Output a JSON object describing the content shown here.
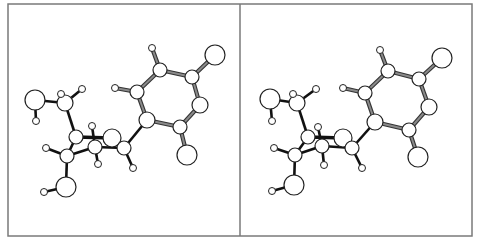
{
  "figure": {
    "type": "stereo-pair ball-and-stick molecular model",
    "frame": {
      "x": 8,
      "y": 4,
      "width": 464,
      "height": 232,
      "divider_x": 240,
      "stroke": "#7a7a7a"
    },
    "colors": {
      "atom_fill": "#ffffff",
      "atom_stroke": "#222222",
      "bond_dark": "#111111",
      "bond_ring_fill": "#8a8a8a",
      "bond_ring_edge": "#333333"
    },
    "panels": [
      {
        "name": "left-view",
        "atoms": [
          {
            "id": "a1",
            "el": "X",
            "x": 215,
            "y": 55,
            "r": 10
          },
          {
            "id": "a2",
            "el": "X",
            "x": 187,
            "y": 155,
            "r": 10
          },
          {
            "id": "a3",
            "el": "O",
            "x": 35,
            "y": 100,
            "r": 10
          },
          {
            "id": "a4",
            "el": "O",
            "x": 112,
            "y": 138,
            "r": 9
          },
          {
            "id": "a5",
            "el": "O",
            "x": 66,
            "y": 187,
            "r": 10
          },
          {
            "id": "c1",
            "el": "C",
            "x": 160,
            "y": 70,
            "r": 7
          },
          {
            "id": "c2",
            "el": "C",
            "x": 192,
            "y": 77,
            "r": 7
          },
          {
            "id": "c3",
            "el": "C",
            "x": 200,
            "y": 105,
            "r": 8
          },
          {
            "id": "c4",
            "el": "C",
            "x": 180,
            "y": 127,
            "r": 7
          },
          {
            "id": "c5",
            "el": "C",
            "x": 147,
            "y": 120,
            "r": 8
          },
          {
            "id": "c6",
            "el": "C",
            "x": 137,
            "y": 92,
            "r": 7
          },
          {
            "id": "c7",
            "el": "C",
            "x": 65,
            "y": 103,
            "r": 8
          },
          {
            "id": "c8",
            "el": "C",
            "x": 76,
            "y": 137,
            "r": 7
          },
          {
            "id": "c9",
            "el": "C",
            "x": 95,
            "y": 147,
            "r": 7
          },
          {
            "id": "c10",
            "el": "C",
            "x": 124,
            "y": 148,
            "r": 7
          },
          {
            "id": "c11",
            "el": "C",
            "x": 67,
            "y": 156,
            "r": 7
          },
          {
            "id": "h1",
            "el": "H",
            "x": 152,
            "y": 48,
            "r": 3.5
          },
          {
            "id": "h2",
            "el": "H",
            "x": 115,
            "y": 88,
            "r": 3.5
          },
          {
            "id": "h3",
            "el": "H",
            "x": 36,
            "y": 121,
            "r": 3.5
          },
          {
            "id": "h4",
            "el": "H",
            "x": 61,
            "y": 94,
            "r": 3.5
          },
          {
            "id": "h5",
            "el": "H",
            "x": 82,
            "y": 89,
            "r": 3.5
          },
          {
            "id": "h6",
            "el": "H",
            "x": 92,
            "y": 126,
            "r": 3.5
          },
          {
            "id": "h7",
            "el": "H",
            "x": 98,
            "y": 164,
            "r": 3.5
          },
          {
            "id": "h8",
            "el": "H",
            "x": 133,
            "y": 168,
            "r": 3.5
          },
          {
            "id": "h9",
            "el": "H",
            "x": 46,
            "y": 148,
            "r": 3.5
          },
          {
            "id": "h10",
            "el": "H",
            "x": 44,
            "y": 192,
            "r": 3.5
          }
        ]
      },
      {
        "name": "right-view",
        "atoms": [
          {
            "id": "a1",
            "el": "X",
            "x": 442,
            "y": 58,
            "r": 10
          },
          {
            "id": "a2",
            "el": "X",
            "x": 418,
            "y": 157,
            "r": 10
          },
          {
            "id": "a3",
            "el": "O",
            "x": 270,
            "y": 99,
            "r": 10
          },
          {
            "id": "a4",
            "el": "O",
            "x": 343,
            "y": 138,
            "r": 9
          },
          {
            "id": "a5",
            "el": "O",
            "x": 294,
            "y": 185,
            "r": 10
          },
          {
            "id": "c1",
            "el": "C",
            "x": 388,
            "y": 71,
            "r": 7
          },
          {
            "id": "c2",
            "el": "C",
            "x": 419,
            "y": 79,
            "r": 7
          },
          {
            "id": "c3",
            "el": "C",
            "x": 429,
            "y": 107,
            "r": 8
          },
          {
            "id": "c4",
            "el": "C",
            "x": 409,
            "y": 130,
            "r": 7
          },
          {
            "id": "c5",
            "el": "C",
            "x": 375,
            "y": 122,
            "r": 8
          },
          {
            "id": "c6",
            "el": "C",
            "x": 365,
            "y": 93,
            "r": 7
          },
          {
            "id": "c7",
            "el": "C",
            "x": 297,
            "y": 103,
            "r": 8
          },
          {
            "id": "c8",
            "el": "C",
            "x": 308,
            "y": 137,
            "r": 7
          },
          {
            "id": "c9",
            "el": "C",
            "x": 322,
            "y": 146,
            "r": 7
          },
          {
            "id": "c10",
            "el": "C",
            "x": 352,
            "y": 148,
            "r": 7
          },
          {
            "id": "c11",
            "el": "C",
            "x": 295,
            "y": 155,
            "r": 7
          },
          {
            "id": "h1",
            "el": "H",
            "x": 380,
            "y": 50,
            "r": 3.5
          },
          {
            "id": "h2",
            "el": "H",
            "x": 343,
            "y": 88,
            "r": 3.5
          },
          {
            "id": "h3",
            "el": "H",
            "x": 272,
            "y": 121,
            "r": 3.5
          },
          {
            "id": "h4",
            "el": "H",
            "x": 293,
            "y": 94,
            "r": 3.5
          },
          {
            "id": "h5",
            "el": "H",
            "x": 316,
            "y": 89,
            "r": 3.5
          },
          {
            "id": "h6",
            "el": "H",
            "x": 318,
            "y": 127,
            "r": 3.5
          },
          {
            "id": "h7",
            "el": "H",
            "x": 324,
            "y": 165,
            "r": 3.5
          },
          {
            "id": "h8",
            "el": "H",
            "x": 362,
            "y": 168,
            "r": 3.5
          },
          {
            "id": "h9",
            "el": "H",
            "x": 274,
            "y": 148,
            "r": 3.5
          },
          {
            "id": "h10",
            "el": "H",
            "x": 272,
            "y": 191,
            "r": 3.5
          }
        ]
      }
    ],
    "bonds": [
      {
        "a": "c1",
        "b": "c2",
        "style": "ring"
      },
      {
        "a": "c2",
        "b": "c3",
        "style": "ring"
      },
      {
        "a": "c3",
        "b": "c4",
        "style": "ring"
      },
      {
        "a": "c4",
        "b": "c5",
        "style": "ring"
      },
      {
        "a": "c5",
        "b": "c6",
        "style": "ring"
      },
      {
        "a": "c6",
        "b": "c1",
        "style": "ring"
      },
      {
        "a": "c2",
        "b": "a1",
        "style": "ring"
      },
      {
        "a": "c4",
        "b": "a2",
        "style": "ring"
      },
      {
        "a": "c1",
        "b": "h1",
        "style": "ring"
      },
      {
        "a": "c6",
        "b": "h2",
        "style": "ring"
      },
      {
        "a": "c5",
        "b": "c10",
        "style": "dark"
      },
      {
        "a": "a3",
        "b": "c7",
        "style": "dark"
      },
      {
        "a": "a3",
        "b": "h3",
        "style": "dark"
      },
      {
        "a": "c7",
        "b": "h4",
        "style": "dark"
      },
      {
        "a": "c7",
        "b": "h5",
        "style": "dark"
      },
      {
        "a": "c7",
        "b": "c8",
        "style": "dark"
      },
      {
        "a": "c8",
        "b": "a4",
        "style": "dark-thick"
      },
      {
        "a": "c8",
        "b": "c11",
        "style": "dark"
      },
      {
        "a": "h6",
        "b": "c9",
        "style": "dark"
      },
      {
        "a": "c11",
        "b": "c9",
        "style": "dark"
      },
      {
        "a": "c9",
        "b": "c10",
        "style": "dark"
      },
      {
        "a": "a4",
        "b": "c10",
        "style": "dark"
      },
      {
        "a": "c9",
        "b": "h7",
        "style": "dark"
      },
      {
        "a": "c10",
        "b": "h8",
        "style": "dark"
      },
      {
        "a": "c11",
        "b": "h9",
        "style": "dark"
      },
      {
        "a": "c11",
        "b": "a5",
        "style": "dark"
      },
      {
        "a": "a5",
        "b": "h10",
        "style": "dark"
      }
    ]
  }
}
